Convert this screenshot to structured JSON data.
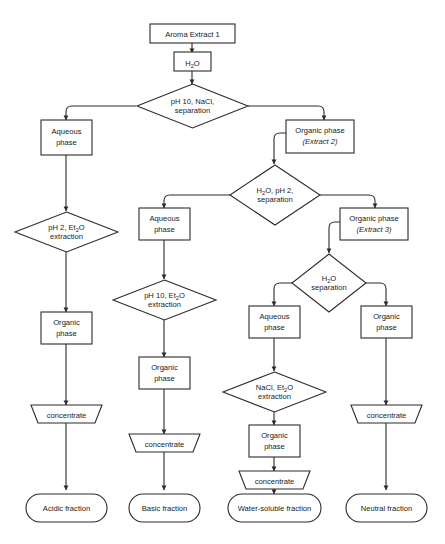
{
  "diagram": {
    "type": "flowchart",
    "colors": {
      "stroke": "#2b2b2b",
      "fill": "#ffffff",
      "text": "#1a1a1a",
      "background": "#ffffff"
    }
  },
  "nodes": {
    "start": {
      "label": "Aroma Extract 1",
      "shape": "rectangle"
    },
    "water1": {
      "label": "H2O",
      "rich": "H₂O",
      "shape": "rectangle"
    },
    "sep1": {
      "line1": "pH 10, NaCl,",
      "line2": "separation",
      "shape": "diamond"
    },
    "aq1": {
      "line1": "Aqueous",
      "line2": "phase",
      "shape": "rectangle"
    },
    "org1": {
      "line1": "Organic phase",
      "line2": "(Extract 2)",
      "shape": "rectangle",
      "emphasis": "italic-second-line"
    },
    "sep2": {
      "line1": "H2O, pH 2,",
      "rich1": "H₂O, pH 2,",
      "line2": "separation",
      "shape": "diamond"
    },
    "aq2": {
      "line1": "Aqueous",
      "line2": "phase",
      "shape": "rectangle"
    },
    "org2": {
      "line1": "Organic phase",
      "line2": "(Extract 3)",
      "shape": "rectangle",
      "emphasis": "italic-second-line"
    },
    "sep3": {
      "line1": "H2O",
      "rich1": "H₂O",
      "line2": "separation",
      "shape": "diamond"
    },
    "aq3": {
      "line1": "Aqueous",
      "line2": "phase",
      "shape": "rectangle"
    },
    "org3": {
      "line1": "Organic",
      "line2": "phase",
      "shape": "rectangle"
    },
    "ext_acid": {
      "line1": "pH 2, Et2O",
      "rich1": "pH 2, Et₂O",
      "line2": "extraction",
      "shape": "diamond"
    },
    "ext_base": {
      "line1": "pH 10, Et2O",
      "rich1": "pH 10, Et₂O",
      "line2": "extraction",
      "shape": "diamond"
    },
    "ext_ws": {
      "line1": "NaCl, Et2O",
      "rich1": "NaCl, Et₂O",
      "line2": "extraction",
      "shape": "diamond"
    },
    "orgA": {
      "line1": "Organic",
      "line2": "phase",
      "shape": "rectangle"
    },
    "orgB": {
      "line1": "Organic",
      "line2": "phase",
      "shape": "rectangle"
    },
    "orgC": {
      "line1": "Organic",
      "line2": "phase",
      "shape": "rectangle"
    },
    "concA": {
      "label": "concentrate",
      "shape": "trapezoid"
    },
    "concB": {
      "label": "concentrate",
      "shape": "trapezoid"
    },
    "concC": {
      "label": "concentrate",
      "shape": "trapezoid"
    },
    "concD": {
      "label": "concentrate",
      "shape": "trapezoid"
    },
    "outA": {
      "label": "Acidic fraction",
      "shape": "rounded"
    },
    "outB": {
      "label": "Basic fraction",
      "shape": "rounded"
    },
    "outC": {
      "label": "Water-soluble fraction",
      "shape": "rounded"
    },
    "outD": {
      "label": "Neutral fraction",
      "shape": "rounded"
    }
  }
}
